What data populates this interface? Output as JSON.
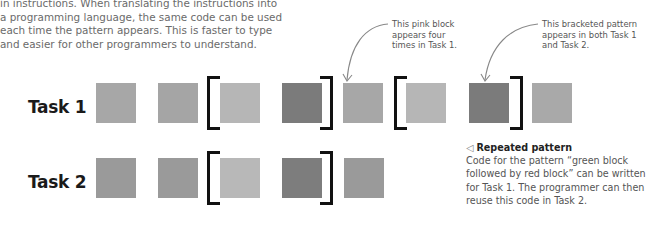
{
  "intro": {
    "lines": [
      "in instructions. When translating the instructions into",
      "a programming language, the same code can be used",
      "each time the pattern appears. This is faster to type",
      "and easier for other programmers to understand."
    ]
  },
  "callouts": [
    {
      "lines": [
        "This pink block",
        "appears four",
        "times in Task 1."
      ]
    },
    {
      "lines": [
        "This bracketed pattern",
        "appears in both Task 1",
        "and Task 2."
      ]
    }
  ],
  "tasks": [
    {
      "label": "Task 1",
      "blocks": [
        {
          "color": "pink",
          "hex": "#a7a7a7"
        },
        {
          "color": "pink",
          "hex": "#a5a5a5"
        },
        {
          "color": "green",
          "hex": "#b6b6b6"
        },
        {
          "color": "red",
          "hex": "#7b7b7b"
        },
        {
          "color": "pink",
          "hex": "#a7a7a7"
        },
        {
          "color": "green",
          "hex": "#b6b6b6"
        },
        {
          "color": "red",
          "hex": "#7b7b7b"
        },
        {
          "color": "pink",
          "hex": "#a9a9a9"
        }
      ]
    },
    {
      "label": "Task 2",
      "blocks": [
        {
          "color": "grey",
          "hex": "#9a9a9a"
        },
        {
          "color": "grey",
          "hex": "#9a9a9a"
        },
        {
          "color": "green",
          "hex": "#b8b8b8"
        },
        {
          "color": "red",
          "hex": "#7d7d7d"
        },
        {
          "color": "grey",
          "hex": "#9a9a9a"
        }
      ]
    }
  ],
  "note": {
    "icon": "left-triangle-icon",
    "title": "Repeated pattern",
    "lines": [
      "Code for the pattern “green block",
      "followed by red block” can be written",
      "for Task 1. The programmer can then",
      "reuse this code in Task 2."
    ]
  }
}
